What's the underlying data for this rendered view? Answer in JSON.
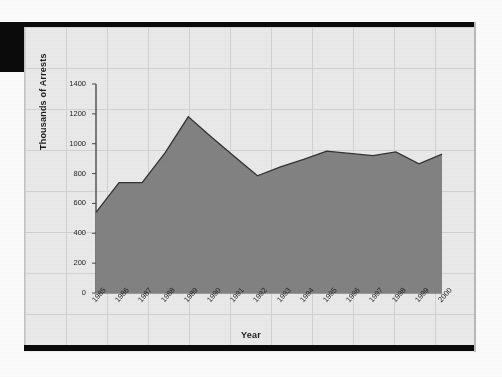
{
  "figure": {
    "background_color": "#ededed",
    "grid_color": "#d2d2d2",
    "area_fill_color": "#828282",
    "area_line_color": "#333333",
    "axis_color": "#4a4a4a"
  },
  "chart_data": {
    "type": "area",
    "title": "",
    "xlabel": "Year",
    "ylabel": "Thousands of Arrests",
    "categories": [
      "1985",
      "1986",
      "1987",
      "1988",
      "1989",
      "1990",
      "1991",
      "1992",
      "1993",
      "1994",
      "1995",
      "1996",
      "1997",
      "1998",
      "1999",
      "2000"
    ],
    "values": [
      540,
      740,
      740,
      940,
      1180,
      1045,
      915,
      785,
      845,
      895,
      950,
      935,
      920,
      945,
      865,
      930
    ],
    "series": [
      {
        "name": "Arrests",
        "values": [
          540,
          740,
          740,
          940,
          1180,
          1045,
          915,
          785,
          845,
          895,
          950,
          935,
          920,
          945,
          865,
          930
        ]
      }
    ],
    "ylim": [
      0,
      1400
    ],
    "yticks": [
      0,
      200,
      400,
      600,
      800,
      1000,
      1200,
      1400
    ],
    "ytick_labels": [
      "0",
      "200",
      "400",
      "600",
      "800",
      "1000",
      "1200",
      "1400"
    ],
    "xtick_labels": [
      "1985",
      "1986",
      "1987",
      "1988",
      "1989",
      "1990",
      "1991",
      "1992",
      "1993",
      "1994",
      "1995",
      "1996",
      "1997",
      "1998",
      "1999",
      "2000"
    ],
    "grid": true,
    "legend": false,
    "legend_position": "none",
    "xtick_rotation": -48
  }
}
